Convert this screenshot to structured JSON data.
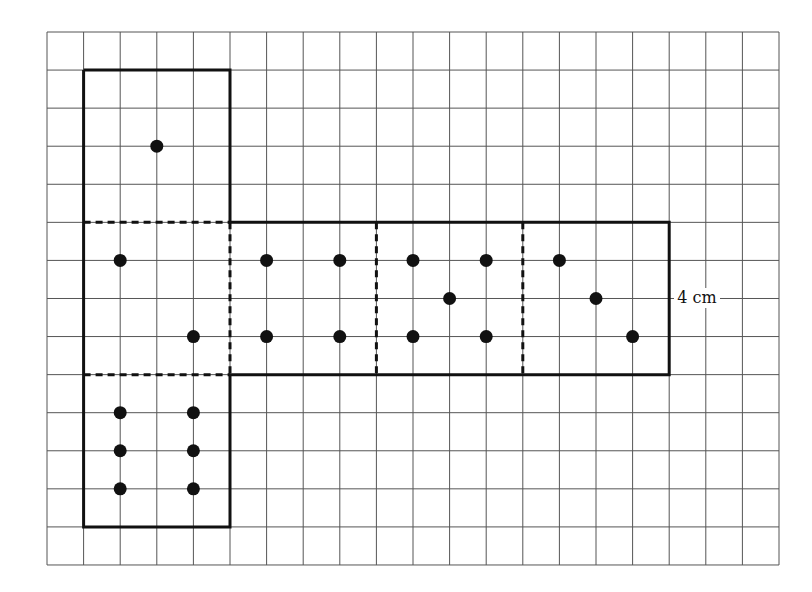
{
  "grid": {
    "origin_x": 47,
    "origin_y": 32,
    "cell_w": 36.6,
    "cell_h": 38.07,
    "cols": 20,
    "rows": 14,
    "line_color": "#555555"
  },
  "outline_color": "#111111",
  "dot_color": "#111111",
  "faces": [
    {
      "name": "face-top",
      "x": 1,
      "y": 1,
      "w": 4,
      "h": 4,
      "dots": [
        [
          3,
          3
        ]
      ]
    },
    {
      "name": "face-left-middle",
      "x": 1,
      "y": 5,
      "w": 4,
      "h": 4,
      "dots": [
        [
          2,
          6
        ],
        [
          4,
          8
        ]
      ]
    },
    {
      "name": "face-center-1",
      "x": 5,
      "y": 5,
      "w": 4,
      "h": 4,
      "dots": [
        [
          6,
          6
        ],
        [
          8,
          6
        ],
        [
          6,
          8
        ],
        [
          8,
          8
        ]
      ]
    },
    {
      "name": "face-center-2",
      "x": 9,
      "y": 5,
      "w": 4,
      "h": 4,
      "dots": [
        [
          10,
          6
        ],
        [
          12,
          6
        ],
        [
          11,
          7
        ],
        [
          10,
          8
        ],
        [
          12,
          8
        ]
      ]
    },
    {
      "name": "face-right",
      "x": 13,
      "y": 5,
      "w": 4,
      "h": 4,
      "dots": [
        [
          14,
          6
        ],
        [
          15,
          7
        ],
        [
          16,
          8
        ]
      ]
    },
    {
      "name": "face-bottom",
      "x": 1,
      "y": 9,
      "w": 4,
      "h": 4,
      "dots": [
        [
          2,
          10
        ],
        [
          4,
          10
        ],
        [
          2,
          11
        ],
        [
          4,
          11
        ],
        [
          2,
          12
        ],
        [
          4,
          12
        ]
      ]
    }
  ],
  "outline": [
    [
      1,
      1
    ],
    [
      5,
      1
    ],
    [
      5,
      5
    ],
    [
      17,
      5
    ],
    [
      17,
      9
    ],
    [
      5,
      9
    ],
    [
      5,
      13
    ],
    [
      1,
      13
    ],
    [
      1,
      1
    ]
  ],
  "fold_lines": [
    [
      [
        1,
        5
      ],
      [
        5,
        5
      ]
    ],
    [
      [
        1,
        9
      ],
      [
        5,
        9
      ]
    ],
    [
      [
        5,
        5
      ],
      [
        5,
        9
      ]
    ],
    [
      [
        9,
        5
      ],
      [
        9,
        9
      ]
    ],
    [
      [
        13,
        5
      ],
      [
        13,
        9
      ]
    ]
  ],
  "dimension_label": {
    "text": "4 cm",
    "col": 17,
    "row": 7
  }
}
